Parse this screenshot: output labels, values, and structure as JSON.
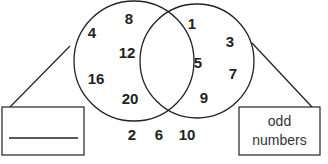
{
  "diagram": {
    "type": "venn",
    "left_set": {
      "label": "",
      "label_is_blank_answer_line": true,
      "members_only": [
        "4",
        "8",
        "12",
        "16",
        "20"
      ]
    },
    "right_set": {
      "label": "odd numbers",
      "label_lines": [
        "odd",
        "numbers"
      ],
      "members_only": [
        "1",
        "3",
        "5",
        "7",
        "9"
      ]
    },
    "intersection": [],
    "outside": [
      "2",
      "6",
      "10"
    ],
    "colors": {
      "stroke": "#222222",
      "text": "#222222",
      "background": "#ffffff"
    }
  },
  "numbers": {
    "n4": "4",
    "n8": "8",
    "n12": "12",
    "n16": "16",
    "n20": "20",
    "n1": "1",
    "n3": "3",
    "n5": "5",
    "n7": "7",
    "n9": "9",
    "n2": "2",
    "n6": "6",
    "n10": "10"
  }
}
